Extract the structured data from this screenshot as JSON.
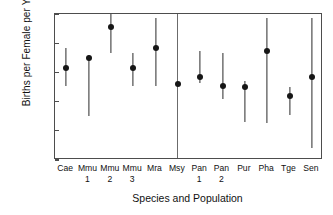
{
  "chart_data": {
    "type": "scatter",
    "title": "",
    "xlabel": "Species and Population",
    "ylabel": "Births per Female per Year",
    "ylim": [
      0,
      1
    ],
    "yticks": [
      "0",
      "0.2",
      "0.4",
      "0.6",
      "0.8",
      "1"
    ],
    "ytick_values": [
      0,
      0.2,
      0.4,
      0.6,
      0.8,
      1
    ],
    "grid": false,
    "legend": "none",
    "error_bar_style": "vertical-line-confidence-interval",
    "group_divider_after": "Msy",
    "categories": [
      "Cae",
      "Mmu 1",
      "Mmu 2",
      "Mmu 3",
      "Mra",
      "Msy",
      "Pan 1",
      "Pan 2",
      "Pur",
      "Pha",
      "Tge",
      "Sen"
    ],
    "category_labels": [
      {
        "name": "Cae",
        "sub": ""
      },
      {
        "name": "Mmu",
        "sub": "1"
      },
      {
        "name": "Mmu",
        "sub": "2"
      },
      {
        "name": "Mmu",
        "sub": "3"
      },
      {
        "name": "Mra",
        "sub": ""
      },
      {
        "name": "Msy",
        "sub": ""
      },
      {
        "name": "Pan",
        "sub": "1"
      },
      {
        "name": "Pan",
        "sub": "2"
      },
      {
        "name": "Pur",
        "sub": ""
      },
      {
        "name": "Pha",
        "sub": ""
      },
      {
        "name": "Tge",
        "sub": ""
      },
      {
        "name": "Sen",
        "sub": ""
      }
    ],
    "values": [
      0.63,
      0.7,
      0.91,
      0.63,
      0.77,
      0.52,
      0.57,
      0.51,
      0.5,
      0.75,
      0.44,
      0.57
    ],
    "err_low": [
      0.51,
      0.3,
      0.73,
      0.51,
      0.51,
      0.52,
      0.53,
      0.42,
      0.26,
      0.25,
      0.31,
      0.08
    ],
    "err_high": [
      0.77,
      0.72,
      1.0,
      0.73,
      0.97,
      0.52,
      0.75,
      0.73,
      0.54,
      0.97,
      0.5,
      0.97
    ],
    "points": [
      {
        "category": "Cae",
        "value": 0.63,
        "low": 0.51,
        "high": 0.77
      },
      {
        "category": "Mmu 1",
        "value": 0.7,
        "low": 0.3,
        "high": 0.72
      },
      {
        "category": "Mmu 2",
        "value": 0.91,
        "low": 0.73,
        "high": 1.0
      },
      {
        "category": "Mmu 3",
        "value": 0.63,
        "low": 0.51,
        "high": 0.73
      },
      {
        "category": "Mra",
        "value": 0.77,
        "low": 0.51,
        "high": 0.97
      },
      {
        "category": "Msy",
        "value": 0.52,
        "low": 0.52,
        "high": 0.52
      },
      {
        "category": "Pan 1",
        "value": 0.57,
        "low": 0.53,
        "high": 0.75
      },
      {
        "category": "Pan 2",
        "value": 0.51,
        "low": 0.42,
        "high": 0.73
      },
      {
        "category": "Pur",
        "value": 0.5,
        "low": 0.26,
        "high": 0.54
      },
      {
        "category": "Pha",
        "value": 0.75,
        "low": 0.25,
        "high": 0.97
      },
      {
        "category": "Tge",
        "value": 0.44,
        "low": 0.31,
        "high": 0.5
      },
      {
        "category": "Sen",
        "value": 0.57,
        "low": 0.08,
        "high": 0.97
      }
    ],
    "colors": {
      "marker": "#161616",
      "error_bar": "#2b2b2b",
      "axis": "#4d4d4d",
      "divider": "#6b6b6b",
      "background": "#ffffff",
      "text": "#111111"
    }
  }
}
